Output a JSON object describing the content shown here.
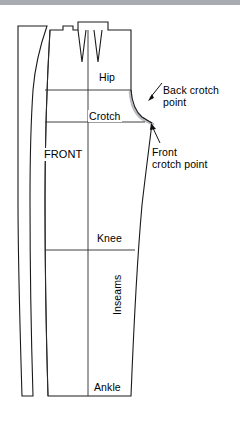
{
  "figure": {
    "type": "sewing-pattern-diagram",
    "background_color": "#ffffff",
    "line_color": "#1a1a1a",
    "shadow_curve_color": "#b9bcc0",
    "top_band_color": "#a8acb1"
  },
  "labels": {
    "hip": "Hip",
    "crotch": "Crotch",
    "front": "FRONT",
    "knee": "Knee",
    "ankle": "Ankle",
    "inseams": "Inseams",
    "back_crotch_point": "Back crotch\npoint",
    "back_crotch_point_line1": "Back crotch",
    "back_crotch_point_line2": "point",
    "front_crotch_point_line1": "Front",
    "front_crotch_point_line2": "crotch point"
  },
  "annotations": [
    {
      "name": "back-crotch-point",
      "text": "Back crotch point",
      "leader": "diagonal arrow pointing down-left to the grey curve"
    },
    {
      "name": "front-crotch-point",
      "text": "Front crotch point",
      "leader": "diagonal arrow pointing up-left to the black curve tip"
    }
  ],
  "horizontal_guides": [
    {
      "name": "hip-line",
      "label": "Hip",
      "y": 90
    },
    {
      "name": "crotch-line",
      "label": "Crotch",
      "y": 122
    },
    {
      "name": "knee-line",
      "label": "Knee",
      "y": 250
    },
    {
      "name": "ankle-line",
      "label": "Ankle",
      "y": 396
    }
  ],
  "shapes": {
    "outer_back_outline": "curved left-most panel edge (back piece)",
    "front_panel_outline": "main trouser front pattern outline",
    "grainline": "vertical center line running full length of front panel",
    "darts": [
      {
        "name": "dart-left",
        "position": "upper center-left"
      },
      {
        "name": "dart-right",
        "position": "upper center-right"
      }
    ],
    "waist_tab": {
      "name": "waist-tab",
      "position": "top edge small notch block"
    }
  }
}
